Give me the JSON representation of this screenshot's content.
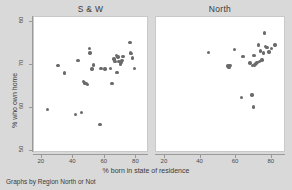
{
  "figure": {
    "background_color": "#d9d9d9",
    "panel_color": "#ffffff",
    "marker_color": "#6a6a6a",
    "note": "Graphs by Region North or Not"
  },
  "chart_data": {
    "type": "scatter",
    "title": "",
    "xlabel": "% born in state of residence",
    "ylabel": "% who own home",
    "xlim": [
      15,
      88
    ],
    "ylim": [
      48,
      82
    ],
    "xticks": [
      20,
      40,
      60,
      80
    ],
    "yticks": [
      50,
      60,
      70,
      80
    ],
    "grid": false,
    "legend": "none",
    "facet_by": "Region North or Not",
    "panels": [
      {
        "label": "S & W",
        "points": [
          [
            24.2,
            59.4
          ],
          [
            30.8,
            69.6
          ],
          [
            35.0,
            67.9
          ],
          [
            41.9,
            58.2
          ],
          [
            43.6,
            70.8
          ],
          [
            45.9,
            58.7
          ],
          [
            47.0,
            65.9
          ],
          [
            47.8,
            65.6
          ],
          [
            48.6,
            65.4
          ],
          [
            49.6,
            65.3
          ],
          [
            50.7,
            73.6
          ],
          [
            51.3,
            72.6
          ],
          [
            52.4,
            68.8
          ],
          [
            53.6,
            69.8
          ],
          [
            57.5,
            56.0
          ],
          [
            58.2,
            68.9
          ],
          [
            60.8,
            68.8
          ],
          [
            64.1,
            69.0
          ],
          [
            65.2,
            65.4
          ],
          [
            66.3,
            71.2
          ],
          [
            67.0,
            70.6
          ],
          [
            68.0,
            72.0
          ],
          [
            68.4,
            68.0
          ],
          [
            69.0,
            71.6
          ],
          [
            69.6,
            70.6
          ],
          [
            70.4,
            70.0
          ],
          [
            71.0,
            70.3
          ],
          [
            71.6,
            70.8
          ],
          [
            72.2,
            71.8
          ],
          [
            76.5,
            75.0
          ],
          [
            77.0,
            72.6
          ],
          [
            77.6,
            72.4
          ],
          [
            78.3,
            71.4
          ],
          [
            79.6,
            68.9
          ]
        ]
      },
      {
        "label": "North",
        "points": [
          [
            45.0,
            72.7
          ],
          [
            56.0,
            69.5
          ],
          [
            56.6,
            69.2
          ],
          [
            57.2,
            69.6
          ],
          [
            59.5,
            73.4
          ],
          [
            63.6,
            62.2
          ],
          [
            64.5,
            71.8
          ],
          [
            68.3,
            70.2
          ],
          [
            69.5,
            62.8
          ],
          [
            69.8,
            69.6
          ],
          [
            70.3,
            60.0
          ],
          [
            70.6,
            72.0
          ],
          [
            70.9,
            69.8
          ],
          [
            71.4,
            70.0
          ],
          [
            71.9,
            70.2
          ],
          [
            72.4,
            70.4
          ],
          [
            73.0,
            74.4
          ],
          [
            73.6,
            70.6
          ],
          [
            74.2,
            73.0
          ],
          [
            75.0,
            70.9
          ],
          [
            75.8,
            72.6
          ],
          [
            76.4,
            77.2
          ],
          [
            77.2,
            74.0
          ],
          [
            78.0,
            73.8
          ],
          [
            79.0,
            72.8
          ],
          [
            80.5,
            73.6
          ],
          [
            82.3,
            74.4
          ]
        ]
      }
    ]
  }
}
